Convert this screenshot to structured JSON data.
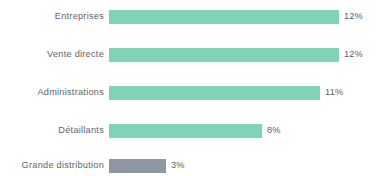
{
  "chart_data": {
    "type": "bar",
    "orientation": "horizontal",
    "title": "",
    "subtitle": "",
    "xlabel": "",
    "ylabel": "",
    "grid": false,
    "legend": "none",
    "axis_visible": false,
    "xlim": [
      0,
      13
    ],
    "value_suffix": "%",
    "categories": [
      "Entreprises",
      "Vente directe",
      "Administrations",
      "Détaillants",
      "Grande distribution"
    ],
    "values": [
      12,
      12,
      11,
      8,
      3
    ],
    "value_labels": [
      "12%",
      "12%",
      "11%",
      "8%",
      "3%"
    ],
    "bar_colors": [
      "#7fd3b5",
      "#7fd3b5",
      "#7fd3b5",
      "#7fd3b5",
      "#8b95a3"
    ],
    "colors": {
      "accent_green": "#7fd3b5",
      "accent_gray": "#8b95a3",
      "label_text": "#5f5f5f",
      "value_text": "#5a5a5a",
      "background": "#ffffff"
    },
    "bars": [
      {
        "category": "Entreprises",
        "value": 12,
        "label": "12%",
        "color": "#7fd3b5"
      },
      {
        "category": "Vente directe",
        "value": 12,
        "label": "12%",
        "color": "#7fd3b5"
      },
      {
        "category": "Administrations",
        "value": 11,
        "label": "11%",
        "color": "#7fd3b5"
      },
      {
        "category": "Détaillants",
        "value": 8,
        "label": "8%",
        "color": "#7fd3b5"
      },
      {
        "category": "Grande distribution",
        "value": 3,
        "label": "3%",
        "color": "#8b95a3"
      }
    ]
  }
}
